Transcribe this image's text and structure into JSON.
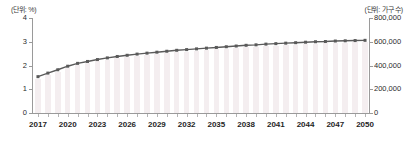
{
  "chart_data": {
    "type": "line",
    "title": "",
    "xlabel": "",
    "left_axis": {
      "unit_label": "(단위: %)",
      "ticks": [
        "0",
        "1",
        "2",
        "3",
        "4"
      ],
      "tick_values": [
        0,
        1,
        2,
        3,
        4
      ],
      "ylim": [
        0,
        4
      ]
    },
    "right_axis": {
      "unit_label": "(단위: 가구 수)",
      "ticks": [
        "0",
        "200,000",
        "400,000",
        "600,000",
        "800,000"
      ],
      "tick_values": [
        0,
        200000,
        400000,
        600000,
        800000
      ],
      "ylim": [
        0,
        800000
      ]
    },
    "x": [
      2017,
      2018,
      2019,
      2020,
      2021,
      2022,
      2023,
      2024,
      2025,
      2026,
      2027,
      2028,
      2029,
      2030,
      2031,
      2032,
      2033,
      2034,
      2035,
      2036,
      2037,
      2038,
      2039,
      2040,
      2041,
      2042,
      2043,
      2044,
      2045,
      2046,
      2047,
      2048,
      2049,
      2050
    ],
    "tick_labels": [
      "2017",
      "2020",
      "2023",
      "2026",
      "2029",
      "2032",
      "2035",
      "2038",
      "2041",
      "2044",
      "2047",
      "2050"
    ],
    "grid": false,
    "legend": "none",
    "series": [
      {
        "name": "비율",
        "type": "line",
        "axis": "left",
        "color": "#5a5a5a",
        "marker": "square",
        "values": [
          1.53,
          1.68,
          1.82,
          1.97,
          2.09,
          2.17,
          2.25,
          2.32,
          2.38,
          2.43,
          2.48,
          2.52,
          2.56,
          2.6,
          2.64,
          2.67,
          2.7,
          2.73,
          2.76,
          2.79,
          2.82,
          2.85,
          2.87,
          2.9,
          2.92,
          2.94,
          2.96,
          2.98,
          3.0,
          3.01,
          3.03,
          3.04,
          3.05,
          3.06
        ]
      },
      {
        "name": "가구 수",
        "type": "bar",
        "axis": "right",
        "color": "#f4eef0",
        "values": [
          290000,
          320000,
          348000,
          378000,
          402000,
          418000,
          434000,
          448000,
          460000,
          470000,
          480000,
          488000,
          496000,
          504000,
          512000,
          518000,
          524000,
          530000,
          536000,
          542000,
          548000,
          554000,
          558000,
          564000,
          568000,
          572000,
          576000,
          580000,
          584000,
          586000,
          590000,
          592000,
          594000,
          596000
        ]
      }
    ]
  }
}
